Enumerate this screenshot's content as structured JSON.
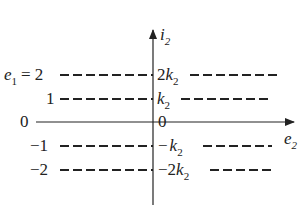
{
  "diagram": {
    "axes": {
      "vertical_label": "i",
      "vertical_label_sub": "2",
      "horizontal_label": "e",
      "horizontal_label_sub": "2",
      "origin_label": "0"
    },
    "left_labels": {
      "param_name": "e",
      "param_sub": "1",
      "equals": "=",
      "values": [
        "2",
        "1",
        "0",
        "−1",
        "−2"
      ]
    },
    "levels": [
      {
        "e1": "2",
        "i2_prefix": "2",
        "i2_var": "k",
        "i2_sub": "2"
      },
      {
        "e1": "1",
        "i2_prefix": "",
        "i2_var": "k",
        "i2_sub": "2"
      },
      {
        "e1": "0",
        "i2_prefix": "0",
        "i2_var": "",
        "i2_sub": ""
      },
      {
        "e1": "−1",
        "i2_prefix": "−",
        "i2_var": "k",
        "i2_sub": "2"
      },
      {
        "e1": "−2",
        "i2_prefix": "−2",
        "i2_var": "k",
        "i2_sub": "2"
      }
    ],
    "colors": {
      "line": "#222222",
      "background": "#ffffff"
    }
  }
}
